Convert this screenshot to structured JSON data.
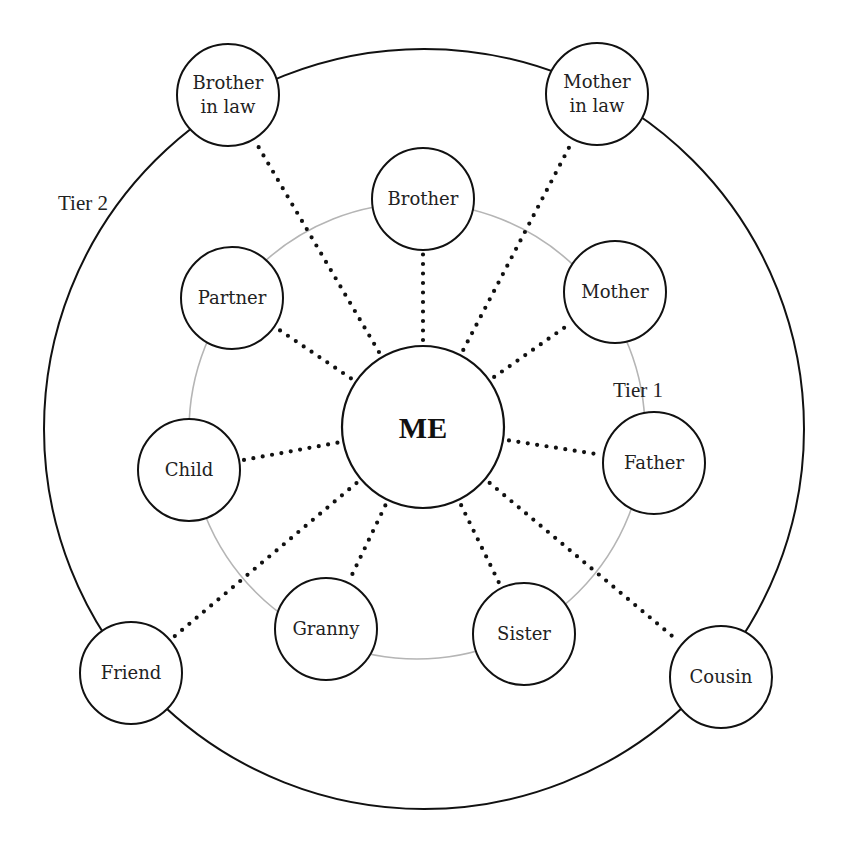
{
  "diagram": {
    "type": "concentric-relationship-map",
    "center": {
      "label": "ME",
      "x": 423,
      "y": 427,
      "r": 81
    },
    "rings": [
      {
        "name": "Tier 1",
        "label": "Tier 1",
        "cx": 417,
        "cy": 431,
        "r": 228,
        "color": "#b5b5b5",
        "label_x": 613,
        "label_y": 397
      },
      {
        "name": "Tier 2",
        "label": "Tier 2",
        "cx": 424,
        "cy": 429,
        "r": 380,
        "color": "#111111",
        "label_x": 58,
        "label_y": 210
      }
    ],
    "nodes": [
      {
        "id": "brother",
        "lines": [
          "Brother"
        ],
        "tier": 1,
        "x": 423,
        "y": 199
      },
      {
        "id": "mother",
        "lines": [
          "Mother"
        ],
        "tier": 1,
        "x": 615,
        "y": 292
      },
      {
        "id": "father",
        "lines": [
          "Father"
        ],
        "tier": 1,
        "x": 654,
        "y": 463
      },
      {
        "id": "sister",
        "lines": [
          "Sister"
        ],
        "tier": 1,
        "x": 524,
        "y": 634
      },
      {
        "id": "granny",
        "lines": [
          "Granny"
        ],
        "tier": 1,
        "x": 326,
        "y": 629
      },
      {
        "id": "child",
        "lines": [
          "Child"
        ],
        "tier": 1,
        "x": 189,
        "y": 470
      },
      {
        "id": "partner",
        "lines": [
          "Partner"
        ],
        "tier": 1,
        "x": 232,
        "y": 298
      },
      {
        "id": "brother-in-law",
        "lines": [
          "Brother",
          "in law"
        ],
        "tier": 2,
        "x": 228,
        "y": 95
      },
      {
        "id": "mother-in-law",
        "lines": [
          "Mother",
          "in law"
        ],
        "tier": 2,
        "x": 597,
        "y": 94
      },
      {
        "id": "cousin",
        "lines": [
          "Cousin"
        ],
        "tier": 2,
        "x": 721,
        "y": 677
      },
      {
        "id": "friend",
        "lines": [
          "Friend"
        ],
        "tier": 2,
        "x": 131,
        "y": 673
      }
    ],
    "node_radius": 51,
    "connector_style": "dotted"
  }
}
